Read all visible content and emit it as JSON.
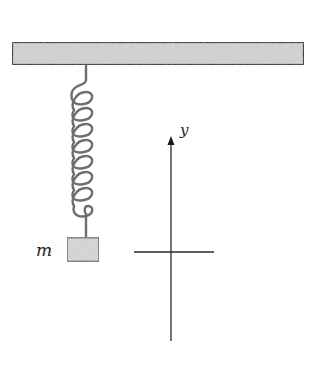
{
  "diagram": {
    "type": "mass-spring system with coordinate axis",
    "ceiling": {
      "x": 11,
      "y": 41,
      "width": 294,
      "height": 25,
      "fill": "#d4d4d4",
      "stroke": "#1a1a1a"
    },
    "spring": {
      "attach_x": 86,
      "top_y": 66,
      "bottom_y": 237,
      "coil_count": 8,
      "color": "#6e6e6e"
    },
    "mass": {
      "label": "m",
      "x": 66,
      "y": 237,
      "width": 33,
      "height": 25,
      "fill": "#d8d8d8",
      "stroke": "#7a7a7a"
    },
    "axis": {
      "label": "y",
      "x": 171,
      "top_y": 137,
      "bottom_y": 341,
      "color": "#2a2a2a"
    },
    "equilibrium_line": {
      "y": 252,
      "x1": 134,
      "x2": 214,
      "color": "#2a2a2a"
    }
  }
}
